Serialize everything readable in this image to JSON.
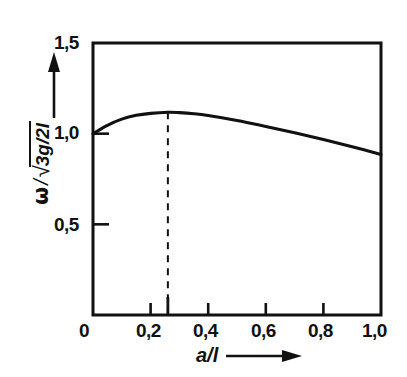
{
  "figure": {
    "background_color": "#ffffff",
    "ink_color": "#111111"
  },
  "axes": {
    "y": {
      "label_omega": "ω",
      "label_slash": "/",
      "label_radical": "√",
      "label_radicand": "3g/2l",
      "arrow_icon": "up-arrow-icon",
      "tick_labels": [
        "1,5",
        "1,0",
        "0,5",
        "0"
      ],
      "tick_values": [
        1.5,
        1.0,
        0.5,
        0.0
      ],
      "min": 0.0,
      "max": 1.5
    },
    "x": {
      "label": "a/l",
      "arrow_icon": "right-arrow-icon",
      "tick_labels": [
        "0",
        "0,2",
        "0,4",
        "0,6",
        "0,8",
        "1,0"
      ],
      "tick_values": [
        0.0,
        0.2,
        0.4,
        0.6,
        0.8,
        1.0
      ],
      "extra_tick_value": 0.26,
      "min": 0.0,
      "max": 1.0
    }
  },
  "annotations": {
    "peak_marker": {
      "style": "dashed-vertical-line",
      "x_value": 0.26,
      "y_value": 1.12
    }
  },
  "chart_data": {
    "type": "line",
    "title": "",
    "xlabel": "a/l",
    "ylabel": "ω/√(3g/2l)",
    "xlim": [
      0.0,
      1.0
    ],
    "ylim": [
      0.0,
      1.5
    ],
    "grid": false,
    "legend": "none",
    "series": [
      {
        "name": "ω/√(3g/2l) vs a/l",
        "x": [
          0.0,
          0.05,
          0.1,
          0.15,
          0.2,
          0.26,
          0.3,
          0.35,
          0.4,
          0.5,
          0.6,
          0.7,
          0.8,
          0.9,
          1.0
        ],
        "values": [
          1.0,
          1.046,
          1.08,
          1.101,
          1.112,
          1.118,
          1.116,
          1.11,
          1.1,
          1.073,
          1.04,
          1.005,
          0.968,
          0.928,
          0.885
        ]
      }
    ],
    "annotations": [
      {
        "type": "vline",
        "x": 0.26,
        "y_top": 1.118,
        "style": "dashed",
        "label": ""
      }
    ]
  }
}
